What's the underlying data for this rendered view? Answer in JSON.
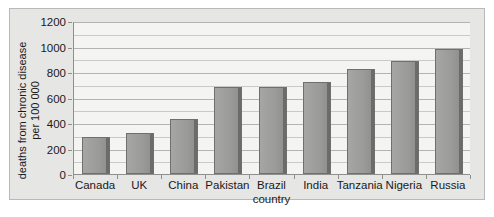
{
  "chart_data": {
    "type": "bar",
    "title": "",
    "subtitle": "",
    "xlabel": "country",
    "ylabel": "deaths from chronic disease per 100 000",
    "ylabel_line1": "deaths from chronic disease",
    "ylabel_line2": "per 100 000",
    "categories": [
      "Canada",
      "UK",
      "China",
      "Pakistan",
      "Brazil",
      "India",
      "Tanzania",
      "Nigeria",
      "Russia"
    ],
    "values": [
      290,
      320,
      435,
      685,
      680,
      725,
      820,
      890,
      980
    ],
    "ylim": [
      0,
      1200
    ],
    "yticks": [
      0,
      200,
      400,
      600,
      800,
      1000,
      1200
    ],
    "ytick_labels": [
      "0",
      "200",
      "400",
      "600",
      "800",
      "1000",
      "1200"
    ],
    "minor_gridlines": [
      100,
      300,
      500,
      700,
      900,
      1100
    ],
    "grid": true,
    "legend": null,
    "legend_position": "none",
    "bar_color": "#9d9d9b",
    "bar_edge_color": "#6f6f6d",
    "plot_background": "#f4f4f2",
    "panel_background": "#e6e6e4",
    "axis_color": "#8f8f8d",
    "gridline_color": "#c9c9c7",
    "text_color": "#1a1a1a"
  }
}
